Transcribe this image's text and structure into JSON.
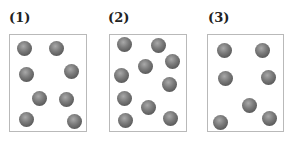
{
  "panels": [
    {
      "label": "(1)",
      "label_pos": [
        9,
        11
      ],
      "box": {
        "x": 9,
        "y": 34,
        "w": 78,
        "h": 98
      },
      "particle_count": 8,
      "particles": [
        [
          24,
          48
        ],
        [
          56,
          48
        ],
        [
          26,
          74
        ],
        [
          71,
          71
        ],
        [
          39,
          98
        ],
        [
          66,
          99
        ],
        [
          26,
          119
        ],
        [
          74,
          121
        ]
      ]
    },
    {
      "label": "(2)",
      "label_pos": [
        108,
        11
      ],
      "box": {
        "x": 109,
        "y": 34,
        "w": 78,
        "h": 98
      },
      "particle_count": 10,
      "particles": [
        [
          124,
          44
        ],
        [
          158,
          45
        ],
        [
          172,
          61
        ],
        [
          145,
          66
        ],
        [
          121,
          75
        ],
        [
          169,
          84
        ],
        [
          124,
          98
        ],
        [
          148,
          107
        ],
        [
          125,
          120
        ],
        [
          170,
          118
        ]
      ]
    },
    {
      "label": "(3)",
      "label_pos": [
        208,
        11
      ],
      "box": {
        "x": 207,
        "y": 34,
        "w": 77,
        "h": 98
      },
      "particle_count": 7,
      "particles": [
        [
          224,
          50
        ],
        [
          262,
          50
        ],
        [
          225,
          78
        ],
        [
          268,
          77
        ],
        [
          249,
          105
        ],
        [
          220,
          122
        ],
        [
          269,
          118
        ]
      ]
    }
  ],
  "colors": {
    "border": "#b9b9b9",
    "particle": "#6e6e6e",
    "label": "#222222"
  }
}
